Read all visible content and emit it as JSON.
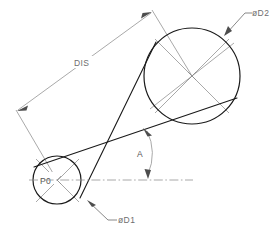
{
  "drawing": {
    "title": "Crossed belt pulley drive layout",
    "canvas": {
      "width": 275,
      "height": 236,
      "background": "#ffffff"
    },
    "colors": {
      "object_line": "#1a1a1a",
      "dimension_line": "#8c8c8c",
      "center_line": "#8c8c8c",
      "leader_line": "#6b6b6b",
      "text": "#6e6e6e"
    },
    "labels": {
      "distance": "DIS",
      "origin_point": "P0",
      "small_pulley_diameter": "øD1",
      "large_pulley_diameter": "øD2",
      "angle": "A"
    },
    "geometry": {
      "small_pulley": {
        "name": "small-pulley",
        "cx": 57,
        "cy": 180,
        "r": 24
      },
      "large_pulley": {
        "name": "large-pulley",
        "cx": 192,
        "cy": 76,
        "r": 48
      },
      "center_distance_line": {
        "name": "dis-dimension",
        "x1": 17,
        "y1": 109,
        "x2": 152,
        "y2": 11
      },
      "horizontal_datum": {
        "name": "horizontal-centerline",
        "x1": 33,
        "y1": 180,
        "x2": 192,
        "y2": 180
      },
      "angle_value_axis": {
        "name": "angle-a",
        "vertex_x": 112,
        "vertex_y": 143
      }
    },
    "icons": {
      "arrow": "arrow-head-icon",
      "center_mark": "center-cross-icon"
    }
  }
}
